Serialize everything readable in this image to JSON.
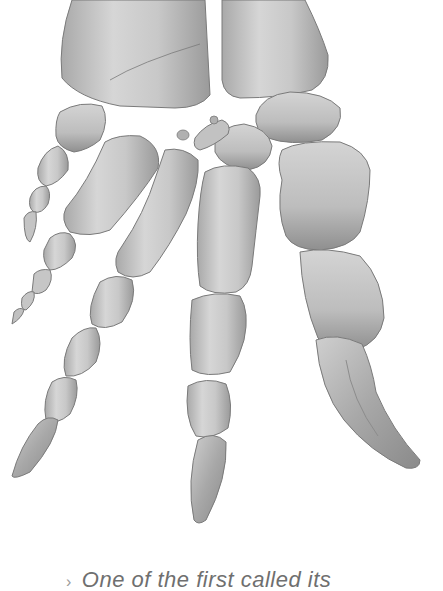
{
  "illustration": {
    "subject": "fossil forelimb skeleton with claws",
    "elements": [
      {
        "name": "radius",
        "label": "left forearm bone end"
      },
      {
        "name": "ulna",
        "label": "right forearm bone end"
      },
      {
        "name": "carpals",
        "label": "wrist bones"
      },
      {
        "name": "digit-1",
        "label": "leftmost small digit"
      },
      {
        "name": "digit-2",
        "label": "second digit"
      },
      {
        "name": "digit-3",
        "label": "third digit with pointed claw"
      },
      {
        "name": "digit-4",
        "label": "central digit with pointed claw"
      },
      {
        "name": "digit-5",
        "label": "thumb with large curved claw"
      }
    ],
    "colors": {
      "bone_light": "#d8d8d8",
      "bone_mid": "#b4b4b4",
      "bone_dark": "#8a8a8a",
      "outline": "#6e6e6e",
      "background": "#ffffff"
    }
  },
  "caption": {
    "marker": "›",
    "text": "One of the first called its"
  }
}
